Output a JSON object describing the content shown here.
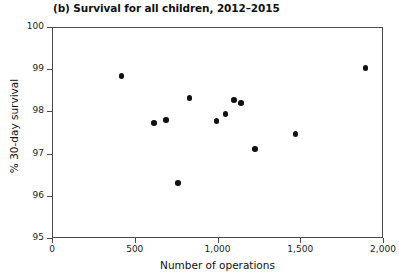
{
  "chart_data": {
    "type": "scatter",
    "title": "(b) Survival for all children, 2012–2015",
    "xlabel": "Number of operations",
    "ylabel": "% 30-day survival",
    "xlim": [
      0,
      2000
    ],
    "ylim": [
      95,
      100
    ],
    "grid": false,
    "legend": null,
    "xticks": [
      0,
      500,
      1000,
      1500,
      2000
    ],
    "xtick_labels": [
      "0",
      "500",
      "1,000",
      "1,500",
      "2,000"
    ],
    "yticks": [
      95,
      96,
      97,
      98,
      99,
      100
    ],
    "ytick_labels": [
      "95",
      "96",
      "97",
      "98",
      "99",
      "100"
    ],
    "marker": "circle",
    "marker_color": "#111111",
    "points": [
      {
        "x": 414,
        "y": 98.86
      },
      {
        "x": 610,
        "y": 97.75
      },
      {
        "x": 684,
        "y": 97.82
      },
      {
        "x": 755,
        "y": 96.33
      },
      {
        "x": 825,
        "y": 98.34
      },
      {
        "x": 988,
        "y": 97.8
      },
      {
        "x": 1043,
        "y": 97.96
      },
      {
        "x": 1092,
        "y": 98.29
      },
      {
        "x": 1135,
        "y": 98.22
      },
      {
        "x": 1221,
        "y": 97.13
      },
      {
        "x": 1465,
        "y": 97.49
      },
      {
        "x": 1888,
        "y": 99.05
      }
    ]
  },
  "figure": {
    "background_color": "#ffffff",
    "axis_color": "#4a4a4a",
    "text_color": "#111111"
  }
}
